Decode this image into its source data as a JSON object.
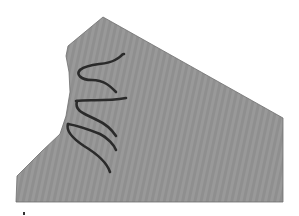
{
  "image": {
    "description": "Grey irregular fabric-like shape with dark wavy strands along its concave left edge",
    "width": 299,
    "height": 216,
    "background_color": "#ffffff"
  },
  "shape": {
    "fill_color": "#8f8f8f",
    "stripe_color": "#999999",
    "edge_color": "#6e6e6e",
    "points": [
      [
        103,
        17
      ],
      [
        283,
        118
      ],
      [
        283,
        202
      ],
      [
        16,
        202
      ],
      [
        17,
        176
      ],
      [
        42,
        151
      ],
      [
        60,
        134
      ],
      [
        66,
        116
      ],
      [
        70,
        92
      ],
      [
        69,
        72
      ],
      [
        66,
        56
      ],
      [
        68,
        46
      ]
    ]
  },
  "strands": {
    "color": "#2a2a2a",
    "width": 2.6,
    "paths": [
      "M 80 70 C 90 62, 105 66, 115 60 S 120 55, 124 54",
      "M 80 70 C 76 74, 80 80, 92 80 C 104 80, 110 86, 116 92",
      "M 76 101 C 88 99, 104 102, 126 98",
      "M 77 101 C 74 112, 86 114, 97 120 C 106 124, 112 130, 116 136",
      "M 68 124 C 80 126, 90 130, 100 134 C 108 138, 114 145, 116 150",
      "M 68 124 C 66 130, 72 138, 84 146 C 94 152, 106 160, 110 172"
    ]
  },
  "marker": {
    "color": "#333333",
    "x": 23,
    "y": 212,
    "w": 2,
    "h": 3
  }
}
